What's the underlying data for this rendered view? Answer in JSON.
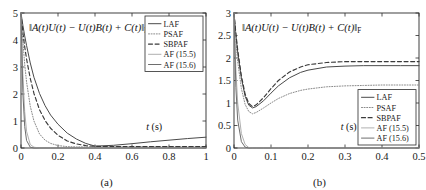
{
  "figure": {
    "panels": [
      {
        "caption": "(a)",
        "title": "‖A(t)U(t) − U(t)B(t) + C(t)‖",
        "title_sub": "F",
        "xlabel": "t (s)",
        "xticks": [
          "0",
          "0.2",
          "0.4",
          "0.6",
          "0.8",
          "1"
        ],
        "yticks": [
          "0",
          "1",
          "2",
          "3",
          "4",
          "5"
        ],
        "legend": [
          {
            "label": "LAF",
            "style": "solid",
            "color": "#4a4a4a"
          },
          {
            "label": "PSAF",
            "style": "dotted",
            "color": "#8a8a8a"
          },
          {
            "label": "SBPAF",
            "style": "dashed",
            "color": "#3a3a3a"
          },
          {
            "label": "AF (15.5)",
            "style": "solid",
            "color": "#b0b0b0"
          },
          {
            "label": "AF (15.6)",
            "style": "solid",
            "color": "#6e6e6e"
          }
        ]
      },
      {
        "caption": "(b)",
        "title": "‖A(t)U(t) − U(t)B(t) + C(t)‖",
        "title_sub": "F",
        "xlabel": "t (s)",
        "xticks": [
          "0",
          "0.1",
          "0.2",
          "0.3",
          "0.4",
          "0.5"
        ],
        "yticks": [
          "0",
          "0.5",
          "1",
          "1.5",
          "2",
          "2.5",
          "3"
        ],
        "legend": [
          {
            "label": "LAF",
            "style": "solid",
            "color": "#4a4a4a"
          },
          {
            "label": "PSAF",
            "style": "dotted",
            "color": "#8a8a8a"
          },
          {
            "label": "SBPAF",
            "style": "dashed",
            "color": "#3a3a3a"
          },
          {
            "label": "AF (15.5)",
            "style": "solid",
            "color": "#b0b0b0"
          },
          {
            "label": "AF (15.6)",
            "style": "solid",
            "color": "#6e6e6e"
          }
        ]
      }
    ]
  },
  "chart_data": [
    {
      "type": "line",
      "panel": "(a)",
      "title": "‖A(t)U(t) − U(t)B(t) + C(t)‖_F",
      "xlabel": "t (s)",
      "ylabel": "",
      "xlim": [
        0,
        1
      ],
      "ylim": [
        0,
        5
      ],
      "xticks": [
        0,
        0.2,
        0.4,
        0.6,
        0.8,
        1
      ],
      "yticks": [
        0,
        1,
        2,
        3,
        4,
        5
      ],
      "grid": false,
      "legend_position": "top-right",
      "x": [
        0,
        0.01,
        0.02,
        0.03,
        0.05,
        0.07,
        0.1,
        0.13,
        0.16,
        0.2,
        0.25,
        0.3,
        0.35,
        0.4,
        0.5,
        0.6,
        0.7,
        0.8,
        0.9,
        1.0
      ],
      "series": [
        {
          "name": "LAF",
          "style": "solid",
          "color": "#4a4a4a",
          "values": [
            5.0,
            4.55,
            4.15,
            3.8,
            3.15,
            2.62,
            2.02,
            1.57,
            1.22,
            0.88,
            0.55,
            0.33,
            0.17,
            0.07,
            0.1,
            0.16,
            0.23,
            0.29,
            0.35,
            0.4
          ]
        },
        {
          "name": "PSAF",
          "style": "dotted",
          "color": "#8a8a8a",
          "values": [
            5.0,
            3.95,
            3.1,
            2.45,
            1.55,
            1.0,
            0.52,
            0.29,
            0.17,
            0.09,
            0.05,
            0.04,
            0.04,
            0.04,
            0.04,
            0.04,
            0.04,
            0.04,
            0.04,
            0.04
          ]
        },
        {
          "name": "SBPAF",
          "style": "dashed",
          "color": "#3a3a3a",
          "values": [
            5.0,
            4.3,
            3.75,
            3.3,
            2.58,
            2.02,
            1.42,
            1.02,
            0.73,
            0.47,
            0.26,
            0.15,
            0.09,
            0.06,
            0.05,
            0.05,
            0.05,
            0.05,
            0.05,
            0.05
          ]
        },
        {
          "name": "AF (15.5)",
          "style": "solid",
          "color": "#b0b0b0",
          "values": [
            5.0,
            2.75,
            1.35,
            0.62,
            0.13,
            0.03,
            0.0,
            0.0,
            0.0,
            0.0,
            0.0,
            0.0,
            0.0,
            0.0,
            0.0,
            0.0,
            0.0,
            0.0,
            0.0,
            0.0
          ]
        },
        {
          "name": "AF (15.6)",
          "style": "solid",
          "color": "#6e6e6e",
          "values": [
            5.0,
            2.05,
            0.8,
            0.28,
            0.03,
            0.0,
            0.0,
            0.0,
            0.0,
            0.0,
            0.0,
            0.0,
            0.0,
            0.0,
            0.0,
            0.0,
            0.0,
            0.0,
            0.0,
            0.0
          ]
        }
      ]
    },
    {
      "type": "line",
      "panel": "(b)",
      "title": "‖A(t)U(t) − U(t)B(t) + C(t)‖_F",
      "xlabel": "t (s)",
      "ylabel": "",
      "xlim": [
        0,
        0.5
      ],
      "ylim": [
        0,
        3
      ],
      "xticks": [
        0,
        0.1,
        0.2,
        0.3,
        0.4,
        0.5
      ],
      "yticks": [
        0,
        0.5,
        1,
        1.5,
        2,
        2.5,
        3
      ],
      "grid": false,
      "legend_position": "bottom-right",
      "x": [
        0,
        0.005,
        0.01,
        0.02,
        0.03,
        0.04,
        0.05,
        0.06,
        0.08,
        0.1,
        0.12,
        0.15,
        0.18,
        0.2,
        0.25,
        0.3,
        0.35,
        0.4,
        0.45,
        0.5
      ],
      "series": [
        {
          "name": "LAF",
          "style": "solid",
          "color": "#4a4a4a",
          "values": [
            3.0,
            2.52,
            2.12,
            1.55,
            1.15,
            0.95,
            0.89,
            0.92,
            1.05,
            1.22,
            1.38,
            1.56,
            1.68,
            1.73,
            1.8,
            1.82,
            1.83,
            1.83,
            1.83,
            1.83
          ]
        },
        {
          "name": "PSAF",
          "style": "dotted",
          "color": "#8a8a8a",
          "values": [
            3.0,
            2.38,
            1.92,
            1.32,
            0.97,
            0.81,
            0.76,
            0.79,
            0.89,
            1.0,
            1.1,
            1.21,
            1.28,
            1.31,
            1.36,
            1.38,
            1.39,
            1.4,
            1.4,
            1.4
          ]
        },
        {
          "name": "SBPAF",
          "style": "dashed",
          "color": "#3a3a3a",
          "values": [
            3.0,
            2.55,
            2.18,
            1.6,
            1.2,
            0.99,
            0.92,
            0.96,
            1.12,
            1.32,
            1.5,
            1.69,
            1.8,
            1.85,
            1.9,
            1.92,
            1.92,
            1.92,
            1.92,
            1.92
          ]
        },
        {
          "name": "AF (15.5)",
          "style": "solid",
          "color": "#b0b0b0",
          "values": [
            3.0,
            1.75,
            1.0,
            0.32,
            0.08,
            0.01,
            0.0,
            0.0,
            0.0,
            0.0,
            0.0,
            0.0,
            0.0,
            0.0,
            0.0,
            0.0,
            0.0,
            0.0,
            0.0,
            0.0
          ]
        },
        {
          "name": "AF (15.6)",
          "style": "solid",
          "color": "#6e6e6e",
          "values": [
            3.0,
            1.35,
            0.62,
            0.14,
            0.02,
            0.0,
            0.0,
            0.0,
            0.0,
            0.0,
            0.0,
            0.0,
            0.0,
            0.0,
            0.0,
            0.0,
            0.0,
            0.0,
            0.0,
            0.0
          ]
        }
      ]
    }
  ]
}
